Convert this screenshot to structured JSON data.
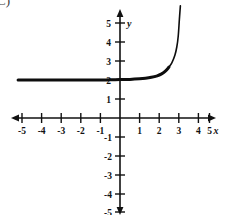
{
  "figure": {
    "corner_label": "C)",
    "background_color": "#ffffff",
    "ink_color": "#111111"
  },
  "chart_data": {
    "type": "line",
    "title": "",
    "subtitle": "",
    "xlabel": "x",
    "ylabel": "y",
    "xlim": [
      -5.6,
      5.6
    ],
    "ylim": [
      -5.4,
      5.6
    ],
    "xticks": [
      -5,
      -4,
      -3,
      -2,
      -1,
      1,
      2,
      3,
      4,
      5
    ],
    "yticks": [
      5,
      4,
      3,
      2,
      1,
      -1,
      -2,
      -3,
      -4,
      -5
    ],
    "xtick_labels": [
      "-5",
      "-4",
      "-3",
      "-2",
      "-1",
      "1",
      "2",
      "3",
      "4",
      "5"
    ],
    "ytick_labels": [
      "5",
      "4",
      "3",
      "2",
      "1",
      "-1",
      "-2",
      "-3",
      "-4",
      "-5"
    ],
    "grid": false,
    "legend": null,
    "axes_arrows": [
      "left",
      "right",
      "up",
      "down"
    ],
    "annotations": [],
    "series": [
      {
        "name": "exponential curve",
        "description": "increasing exponential with horizontal asymptote y = 2",
        "asymptote_y": 2,
        "color": "#0d0d0d",
        "x": [
          -5.2,
          -4.5,
          -4.0,
          -3.5,
          -3.0,
          -2.5,
          -2.0,
          -1.5,
          -1.0,
          -0.5,
          0.0,
          0.5,
          1.0,
          1.3,
          1.6,
          1.9,
          2.1,
          2.3,
          2.5,
          2.65,
          2.8,
          2.9,
          2.97,
          3.03,
          3.08
        ],
        "y": [
          2.0,
          2.0,
          2.0,
          2.0,
          2.0,
          2.0,
          2.0,
          2.0,
          2.0,
          2.01,
          2.02,
          2.03,
          2.06,
          2.09,
          2.14,
          2.22,
          2.31,
          2.45,
          2.68,
          2.92,
          3.3,
          3.75,
          4.3,
          5.2,
          5.9
        ]
      }
    ]
  }
}
